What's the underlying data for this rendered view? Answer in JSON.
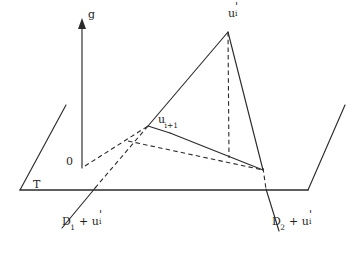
{
  "figure": {
    "background_color": "#ffffff",
    "line_color": "#2b2b2b",
    "width": 364,
    "height": 253,
    "caption": ""
  },
  "labels": {
    "apex": {
      "base": "u",
      "prime": "'",
      "subscript": "i",
      "text": "u'i"
    },
    "midpoint": {
      "base": "u",
      "subscript": "i+1",
      "text": "ui+1"
    },
    "axis_g": "g",
    "origin": "0",
    "plane_t": "T",
    "d1": {
      "prefix": "D",
      "subscript": "1",
      "operator": "+",
      "term_base": "u",
      "term_prime": "'",
      "term_subscript": "i",
      "text": "D1 + u'i"
    },
    "d2": {
      "prefix": "D",
      "subscript": "2",
      "operator": "+",
      "term_base": "u",
      "term_prime": "'",
      "term_subscript": "i",
      "text": "D2 + u'i"
    }
  },
  "geometry": {
    "baseline": {
      "x1": 20,
      "y1": 190,
      "x2": 308,
      "y2": 190
    },
    "left_slant": {
      "x1": 20,
      "y1": 190,
      "x2": 66,
      "y2": 105
    },
    "right_slant": {
      "x1": 308,
      "y1": 190,
      "x2": 345,
      "y2": 105
    },
    "vertical_axis": {
      "x": 82,
      "y_bottom": 168,
      "y_top": 22
    },
    "triangle": {
      "apex": {
        "x": 228,
        "y": 32
      },
      "left_vertex": {
        "x": 148,
        "y": 126
      },
      "right_vertex": {
        "x": 263,
        "y": 170
      }
    },
    "dashed_altitude": {
      "x1": 228,
      "y1": 32,
      "x2": 229,
      "y2": 158
    },
    "dashed_from_origin": {
      "x1": 84,
      "y1": 166,
      "x2": 148,
      "y2": 126
    },
    "dashed_to_base": {
      "x1": 132,
      "y1": 143,
      "x2": 263,
      "y2": 170
    },
    "d1_line_dashed": {
      "x1": 95,
      "y1": 188,
      "x2": 148,
      "y2": 126
    },
    "d1_line_solid": {
      "x1": 95,
      "y1": 188,
      "x2": 62,
      "y2": 228
    },
    "d2_line_dashed": {
      "x1": 263,
      "y1": 170,
      "x2": 266,
      "y2": 190
    },
    "d2_line_solid": {
      "x1": 266,
      "y1": 190,
      "x2": 278,
      "y2": 230
    }
  }
}
